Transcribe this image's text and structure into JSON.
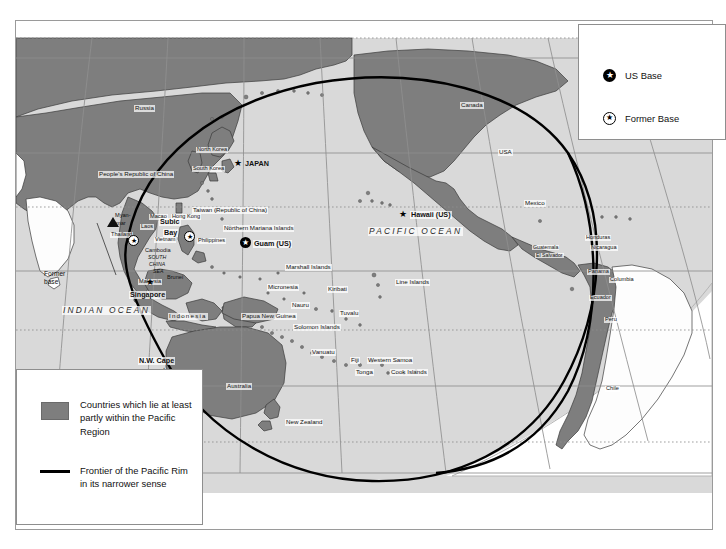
{
  "map": {
    "title": "Pacific Rim Map",
    "oceans": [
      {
        "name": "PACIFIC OCEAN",
        "x": 352,
        "y": 206
      },
      {
        "name": "INDIAN OCEAN",
        "x": 46,
        "y": 285
      }
    ],
    "labels": [
      {
        "name": "Russia",
        "text": "Russia",
        "x": 118,
        "y": 84,
        "size": "t6"
      },
      {
        "name": "Canada",
        "text": "Canada",
        "x": 444,
        "y": 81,
        "size": "t6"
      },
      {
        "name": "USA",
        "text": "USA",
        "x": 482,
        "y": 128,
        "size": "t6"
      },
      {
        "name": "Mexico",
        "text": "Mexico",
        "x": 508,
        "y": 179,
        "size": "t6"
      },
      {
        "name": "Guatemala",
        "text": "Guatemala",
        "x": 516,
        "y": 224,
        "size": "t5"
      },
      {
        "name": "El Salvador",
        "text": "El Salvador",
        "x": 519,
        "y": 232,
        "size": "t5"
      },
      {
        "name": "Honduras",
        "text": "Honduras",
        "x": 569,
        "y": 214,
        "size": "t55"
      },
      {
        "name": "Nicaragua",
        "text": "Nicaragua",
        "x": 574,
        "y": 224,
        "size": "t55"
      },
      {
        "name": "Panama",
        "text": "Panama",
        "x": 571,
        "y": 248,
        "size": "t55"
      },
      {
        "name": "Columbia",
        "text": "Columbia",
        "x": 593,
        "y": 256,
        "size": "t55"
      },
      {
        "name": "Ecuador",
        "text": "Ecuador",
        "x": 573,
        "y": 274,
        "size": "t55"
      },
      {
        "name": "Peru",
        "text": "Peru",
        "x": 588,
        "y": 296,
        "size": "t55"
      },
      {
        "name": "Chile",
        "text": "Chile",
        "x": 589,
        "y": 365,
        "size": "t55"
      },
      {
        "name": "North Korea",
        "text": "North Korea",
        "x": 180,
        "y": 126,
        "size": "t55"
      },
      {
        "name": "South Korea",
        "text": "South Korea",
        "x": 176,
        "y": 145,
        "size": "t55"
      },
      {
        "name": "Japan",
        "text": "JAPAN",
        "x": 228,
        "y": 143,
        "size": "t7 bold"
      },
      {
        "name": "Peoples-Republic-of-China",
        "text": "People's Republic of China",
        "x": 82,
        "y": 150,
        "size": "t6"
      },
      {
        "name": "Taiwan",
        "text": "Taiwan (Republic of China)",
        "x": 176,
        "y": 186,
        "size": "t6"
      },
      {
        "name": "Macao",
        "text": "Macao",
        "x": 133,
        "y": 193,
        "size": "t55"
      },
      {
        "name": "Hong-Kong",
        "text": "Hong Kong",
        "x": 155,
        "y": 193,
        "size": "t55"
      },
      {
        "name": "Myanmar",
        "text": "Myan-",
        "x": 98,
        "y": 192,
        "size": "t55"
      },
      {
        "name": "Myanmar2",
        "text": "mar",
        "x": 99,
        "y": 200,
        "size": "t55"
      },
      {
        "name": "Laos",
        "text": "Laos",
        "x": 124,
        "y": 203,
        "size": "t55"
      },
      {
        "name": "Thailand",
        "text": "Thailand",
        "x": 94,
        "y": 211,
        "size": "t55"
      },
      {
        "name": "Vietnam",
        "text": "Vietnam",
        "x": 138,
        "y": 216,
        "size": "t55"
      },
      {
        "name": "Cambodia",
        "text": "Cambodia",
        "x": 128,
        "y": 227,
        "size": "t55"
      },
      {
        "name": "Subic-Bay-1",
        "text": "Subic",
        "x": 143,
        "y": 199,
        "size": "t7 bold"
      },
      {
        "name": "Subic-Bay-2",
        "text": "Bay",
        "x": 147,
        "y": 210,
        "size": "t7 bold"
      },
      {
        "name": "Philippines",
        "text": "Philippines",
        "x": 181,
        "y": 217,
        "size": "t55"
      },
      {
        "name": "South-China-Sea-1",
        "text": "SOUTH",
        "x": 131,
        "y": 234,
        "size": "t5 ital"
      },
      {
        "name": "South-China-Sea-2",
        "text": "CHINA",
        "x": 132,
        "y": 241,
        "size": "t5 ital"
      },
      {
        "name": "South-China-Sea-3",
        "text": "SEA",
        "x": 136,
        "y": 248,
        "size": "t5 ital"
      },
      {
        "name": "Brunei",
        "text": "Brunei",
        "x": 150,
        "y": 254,
        "size": "t55"
      },
      {
        "name": "Malaysia",
        "text": "Malaysia",
        "x": 122,
        "y": 258,
        "size": "t55"
      },
      {
        "name": "Singapore",
        "text": "Singapore",
        "x": 113,
        "y": 272,
        "size": "t7 bold"
      },
      {
        "name": "Indonesia",
        "text": "Indonesia",
        "x": 152,
        "y": 292,
        "size": "t6"
      },
      {
        "name": "Northern-Mariana-Islands",
        "text": "Northern Mariana Islands",
        "x": 207,
        "y": 204,
        "size": "t6"
      },
      {
        "name": "Guam",
        "text": "Guam (US)",
        "x": 237,
        "y": 223,
        "size": "t7 bold"
      },
      {
        "name": "Hawaii",
        "text": "Hawaii (US)",
        "x": 394,
        "y": 194,
        "size": "t7 bold"
      },
      {
        "name": "Marshall-Islands",
        "text": "Marshall Islands",
        "x": 269,
        "y": 243,
        "size": "t6"
      },
      {
        "name": "Micronesia",
        "text": "Micronesia",
        "x": 251,
        "y": 263,
        "size": "t6"
      },
      {
        "name": "Kiribati",
        "text": "Kiribati",
        "x": 311,
        "y": 269,
        "size": "t6"
      },
      {
        "name": "Line-Islands",
        "text": "Line Islands",
        "x": 379,
        "y": 262,
        "size": "t6"
      },
      {
        "name": "Nauru",
        "text": "Nauru",
        "x": 275,
        "y": 281,
        "size": "t6"
      },
      {
        "name": "Papua-New-Guinea",
        "text": "Papua New Guinea",
        "x": 225,
        "y": 294,
        "size": "t6"
      },
      {
        "name": "Tuvalu",
        "text": "Tuvalu",
        "x": 323,
        "y": 293,
        "size": "t6"
      },
      {
        "name": "Solomon-Islands",
        "text": "Solomon Islands",
        "x": 277,
        "y": 305,
        "size": "t6"
      },
      {
        "name": "Vanuatu",
        "text": "Vanuatu",
        "x": 295,
        "y": 330,
        "size": "t6"
      },
      {
        "name": "Fiji",
        "text": "Fiji",
        "x": 334,
        "y": 340,
        "size": "t6"
      },
      {
        "name": "Western-Samoa",
        "text": "Western Samoa",
        "x": 351,
        "y": 340,
        "size": "t6"
      },
      {
        "name": "Tonga",
        "text": "Tonga",
        "x": 339,
        "y": 350,
        "size": "t6"
      },
      {
        "name": "Cook-Islands",
        "text": "Cook Islands",
        "x": 374,
        "y": 350,
        "size": "t6"
      },
      {
        "name": "Australia",
        "text": "Australia",
        "x": 210,
        "y": 364,
        "size": "t6"
      },
      {
        "name": "New-Zealand",
        "text": "New Zealand",
        "x": 269,
        "y": 400,
        "size": "t6"
      },
      {
        "name": "NW-Cape",
        "text": "N.W. Cape",
        "x": 122,
        "y": 338,
        "size": "t7 bold"
      }
    ],
    "former_base_annotation": {
      "name": "former-base-annotation",
      "line1": "Former",
      "line2": "base"
    },
    "markers": [
      {
        "name": "marker-japan",
        "kind": "plain",
        "x": 218,
        "y": 141
      },
      {
        "name": "marker-hawaii",
        "kind": "plain",
        "x": 383,
        "y": 192
      },
      {
        "name": "marker-singapore",
        "kind": "plain",
        "x": 130,
        "y": 260
      },
      {
        "name": "marker-nw-cape",
        "kind": "plain",
        "x": 144,
        "y": 349
      },
      {
        "name": "marker-guam",
        "kind": "circle",
        "x": 224,
        "y": 218
      },
      {
        "name": "marker-subic-bay",
        "kind": "outlined",
        "x": 168,
        "y": 212
      },
      {
        "name": "marker-thailand",
        "kind": "outlined",
        "x": 112,
        "y": 216
      }
    ]
  },
  "legend_bases": {
    "name": "us-base-legend",
    "rows": [
      {
        "icon": "filled-star-icon",
        "label": "US Base"
      },
      {
        "icon": "outlined-star-icon",
        "label": "Former Base"
      }
    ]
  },
  "legend_key": {
    "name": "map-key-legend",
    "area_label": "Countries which lie at least partly within the Pacific Region",
    "line_label": "Frontier of the Pacific Rim in its narrower sense",
    "swatch_color": "#7e7e7e",
    "line_color": "#000000"
  },
  "colors": {
    "pacific_land": "#7e7e7e",
    "other_land": "#fdfdfd",
    "ocean": "#d9d9d9",
    "outline": "#3b3b3b",
    "frontier": "#000000",
    "graticule": "#8f8f8f"
  }
}
